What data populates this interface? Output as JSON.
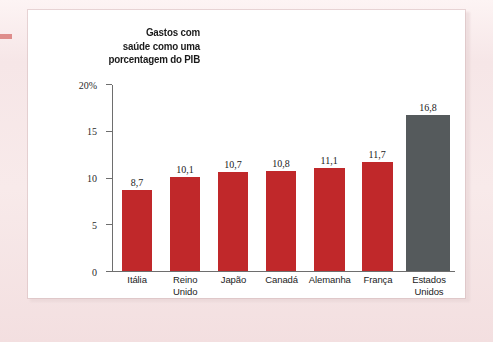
{
  "chart_data": {
    "type": "bar",
    "title": "Gastos com saúde como uma porcentagem do PIB",
    "title_lines": [
      "Gastos com",
      "saúde como uma",
      "porcentagem do PIB"
    ],
    "xlabel": "",
    "ylabel": "",
    "ylim": [
      0,
      20
    ],
    "grid": false,
    "legend": null,
    "y_ticks": [
      "0",
      "5",
      "10",
      "15",
      "20%"
    ],
    "y_tick_values": [
      0,
      5,
      10,
      15,
      20
    ],
    "categories": [
      "Itália",
      "Reino Unido",
      "Japão",
      "Canadá",
      "Alemanha",
      "França",
      "Estados Unidos"
    ],
    "category_lines": [
      [
        "Itália"
      ],
      [
        "Reino",
        "Unido"
      ],
      [
        "Japão"
      ],
      [
        "Canadá"
      ],
      [
        "Alemanha"
      ],
      [
        "França"
      ],
      [
        "Estados",
        "Unidos"
      ]
    ],
    "values": [
      8.7,
      10.1,
      10.7,
      10.8,
      11.1,
      11.7,
      16.8
    ],
    "value_labels": [
      "8,7",
      "10,1",
      "10,7",
      "10,8",
      "11,1",
      "11,7",
      "16,8"
    ],
    "bar_colors": [
      "#c0282a",
      "#c0282a",
      "#c0282a",
      "#c0282a",
      "#c0282a",
      "#c0282a",
      "#555a5c"
    ],
    "highlight_category": "Estados Unidos",
    "colors": {
      "bar_red": "#c0282a",
      "bar_gray": "#555a5c",
      "axis": "#6e6e6e",
      "text": "#1b1b1b",
      "panel": "#ffffff",
      "page": "#f6e6e7"
    }
  }
}
